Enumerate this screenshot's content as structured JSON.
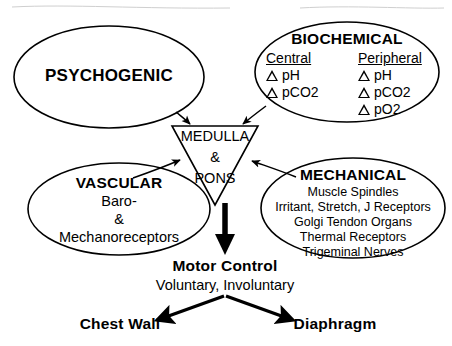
{
  "diagram": {
    "background": "#ffffff",
    "stroke": "#000000"
  },
  "psychogenic": {
    "label": "PSYCHOGENIC"
  },
  "biochemical": {
    "title": "BIOCHEMICAL",
    "central": {
      "heading": "Central",
      "items": [
        "pH",
        "pCO2"
      ]
    },
    "peripheral": {
      "heading": "Peripheral",
      "items": [
        "pH",
        "pCO2",
        "pO2"
      ]
    },
    "marker_icon": "delta-triangle-icon"
  },
  "vascular": {
    "title": "VASCULAR",
    "lines": [
      "Baro-",
      "&",
      "Mechanoreceptors"
    ]
  },
  "mechanical": {
    "title": "MECHANICAL",
    "lines": [
      "Muscle Spindles",
      "Irritant, Stretch, J Receptors",
      "Golgi Tendon Organs",
      "Thermal Receptors",
      "Trigeminal Nerves"
    ]
  },
  "integrator": {
    "line1": "MEDULLA",
    "line2": "&",
    "line3": "PONS"
  },
  "output": {
    "title": "Motor Control",
    "subtitle": "Voluntary, Involuntary",
    "targets": [
      "Chest Wall",
      "Diaphragm"
    ]
  }
}
